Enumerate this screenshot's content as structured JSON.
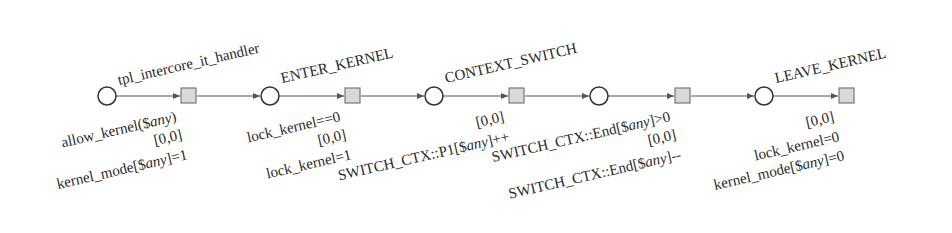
{
  "diagram": {
    "type": "petri-net-sequence",
    "nodes": [
      {
        "id": "p1",
        "kind": "place",
        "cx": 107,
        "cy": 96,
        "label": "tpl_intercore_it_handler"
      },
      {
        "id": "t1",
        "kind": "transition",
        "x": 181,
        "y": 89,
        "guard": "allow_kernel($any)",
        "interval": "[0,0]",
        "update": "kernel_mode[$any]=1"
      },
      {
        "id": "p2",
        "kind": "place",
        "cx": 270,
        "cy": 96,
        "label": "ENTER_KERNEL"
      },
      {
        "id": "t2",
        "kind": "transition",
        "x": 345,
        "y": 89,
        "guard": "lock_kernel==0",
        "interval": "[0,0]",
        "update": "lock_kernel=1"
      },
      {
        "id": "p3",
        "kind": "place",
        "cx": 434,
        "cy": 96,
        "label": "CONTEXT_SWITCH"
      },
      {
        "id": "t3",
        "kind": "transition",
        "x": 509,
        "y": 89,
        "guard": "",
        "interval": "[0,0]",
        "update": "SWITCH_CTX::P1[$any]++"
      },
      {
        "id": "p4",
        "kind": "place",
        "cx": 599,
        "cy": 96,
        "label": ""
      },
      {
        "id": "t4",
        "kind": "transition",
        "x": 675,
        "y": 89,
        "guard": "SWITCH_CTX::End[$any]>0",
        "interval": "[0,0]",
        "update": "SWITCH_CTX::End[$any]--"
      },
      {
        "id": "p5",
        "kind": "place",
        "cx": 764,
        "cy": 96,
        "label": "LEAVE_KERNEL"
      },
      {
        "id": "t5",
        "kind": "transition",
        "x": 839,
        "y": 89,
        "guard": "",
        "interval": "[0,0]",
        "update": "lock_kernel=0",
        "update2": "kernel_mode[$any]=0"
      }
    ],
    "labels": {
      "p1": "tpl_intercore_it_handler",
      "p2": "ENTER_KERNEL",
      "p3": "CONTEXT_SWITCH",
      "p5": "LEAVE_KERNEL",
      "t1_guard_pre": "allow_kernel($",
      "t1_guard_it": "any",
      "t1_guard_post": ")",
      "t1_interval": "[0,0]",
      "t1_update_pre": "kernel_mode[$",
      "t1_update_it": "any",
      "t1_update_post": "]=1",
      "t2_guard": "lock_kernel==0",
      "t2_interval": "[0,0]",
      "t2_update": "lock_kernel=1",
      "t3_interval": "[0,0]",
      "t3_update_pre": "SWITCH_CTX::P1[$",
      "t3_update_it": "any",
      "t3_update_post": "]++",
      "t4_guard_pre": "SWITCH_CTX::End[$",
      "t4_guard_it": "any",
      "t4_guard_post": "]>0",
      "t4_interval": "[0,0]",
      "t4_update_pre": "SWITCH_CTX::End[$",
      "t4_update_it": "any",
      "t4_update_post": "]--",
      "t5_interval": "[0,0]",
      "t5_update1": "lock_kernel=0",
      "t5_update2_pre": "kernel_mode[$",
      "t5_update2_it": "any",
      "t5_update2_post": "]=0"
    },
    "colors": {
      "place_stroke": "#333333",
      "transition_fill": "#d9d9d9",
      "transition_stroke": "#777777",
      "arc": "#555555"
    }
  }
}
